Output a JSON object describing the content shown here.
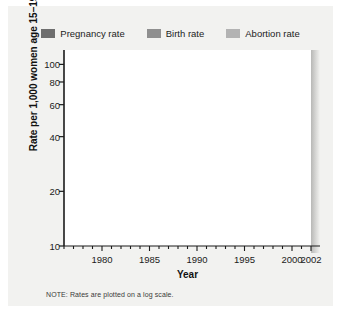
{
  "figure": {
    "note": "NOTE: Rates are plotted on a log scale."
  },
  "legend": {
    "items": [
      {
        "label": "Pregnancy rate",
        "color": "#6e6e6e",
        "name": "legend-pregnancy"
      },
      {
        "label": "Birth rate",
        "color": "#8f8f8f",
        "name": "legend-birth"
      },
      {
        "label": "Abortion rate",
        "color": "#b3b3b3",
        "name": "legend-abortion"
      }
    ]
  },
  "chart_data": {
    "type": "line",
    "title": "",
    "xlabel": "Year",
    "ylabel": "Rate per 1,000 women age 15–19",
    "yscale": "log",
    "ylim": [
      10,
      120
    ],
    "xlim": [
      1976,
      2002
    ],
    "grid": true,
    "legend_position": "top",
    "yticks": [
      100,
      80,
      60,
      40,
      20,
      10
    ],
    "ytick_labels": [
      "100",
      "80",
      "60",
      "40",
      "20",
      "10"
    ],
    "xticks": [
      1980,
      1985,
      1990,
      1995,
      2000,
      2002
    ],
    "xtick_labels": [
      "1980",
      "1985",
      "1990",
      "1995",
      "2000",
      "2002"
    ],
    "xtick_minor_step": 1,
    "series": [
      {
        "name": "Pregnancy rate",
        "color": "#6e6e6e",
        "x": [
          1976,
          1977,
          1978,
          1979,
          1980,
          1981,
          1982,
          1983,
          1984,
          1985,
          1986,
          1987,
          1988,
          1989,
          1990,
          1991,
          1992,
          1993,
          1994,
          1995,
          1996,
          1997,
          1998,
          1999,
          2000
        ],
        "values": [
          101,
          101.5,
          103,
          105,
          105.5,
          104.5,
          103.5,
          102.5,
          102,
          103.5,
          101.5,
          101,
          104,
          106.5,
          108,
          108.5,
          106,
          104.5,
          103,
          99.5,
          96,
          93,
          90,
          86,
          82
        ]
      },
      {
        "name": "Birth rate",
        "color": "#8f8f8f",
        "x": [
          1976,
          1977,
          1978,
          1979,
          1980,
          1981,
          1982,
          1983,
          1984,
          1985,
          1986,
          1987,
          1988,
          1989,
          1990,
          1991,
          1992,
          1993,
          1994,
          1995,
          1996,
          1997,
          1998,
          1999,
          2000,
          2001,
          2002
        ],
        "values": [
          53.5,
          52.8,
          51.5,
          52.3,
          53,
          52.2,
          52.4,
          51.7,
          50.6,
          51.0,
          50.2,
          50.6,
          53.0,
          57.3,
          59.9,
          61.8,
          60.3,
          59.0,
          58.2,
          56.0,
          53.5,
          51.3,
          50.3,
          48.8,
          47.7,
          45.3,
          43.0
        ]
      },
      {
        "name": "Abortion rate",
        "color": "#b3b3b3",
        "x": [
          1976,
          1977,
          1978,
          1979,
          1980,
          1981,
          1982,
          1983,
          1984,
          1985,
          1986,
          1987,
          1988,
          1989,
          1990,
          1991,
          1992,
          1993,
          1994,
          1995,
          1996,
          1997,
          1998,
          1999,
          2000
        ],
        "values": [
          34.3,
          37.6,
          40.5,
          42.3,
          42.8,
          42.9,
          42.7,
          43.2,
          42.9,
          43.5,
          41.8,
          41.0,
          43.5,
          41.5,
          40.3,
          37.5,
          35.2,
          33.3,
          31.0,
          29.4,
          28.0,
          26.7,
          26.0,
          25.2,
          24.5
        ]
      }
    ]
  }
}
